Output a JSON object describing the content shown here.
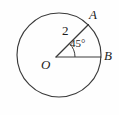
{
  "figure": {
    "kind": "geometry-diagram",
    "background_color": "#fefefe",
    "stroke_color": "#3a3a3a",
    "text_color": "#1c1c1c",
    "circle": {
      "center_x": 59,
      "center_y": 55,
      "radius": 42,
      "stroke_width": 1.1
    },
    "center_point": {
      "name": "center-point-o",
      "x": 56,
      "y": 57
    },
    "radii": [
      {
        "name": "radius-oa",
        "from_x": 56,
        "from_y": 57,
        "to_x": 88,
        "to_y": 25,
        "length_label": "2",
        "angle_degrees": 45
      },
      {
        "name": "radius-ob",
        "from_x": 56,
        "from_y": 57,
        "to_x": 101,
        "to_y": 57,
        "length_label": "",
        "angle_degrees": 0
      }
    ],
    "angle_arc": {
      "name": "angle-arc-aob",
      "vertex_x": 56,
      "vertex_y": 57,
      "radius": 19,
      "start_degrees": 0,
      "end_degrees": 45
    },
    "labels": {
      "point_a": "A",
      "point_b": "B",
      "center_o": "O",
      "radius_length": "2",
      "angle_measure": "45°"
    }
  }
}
